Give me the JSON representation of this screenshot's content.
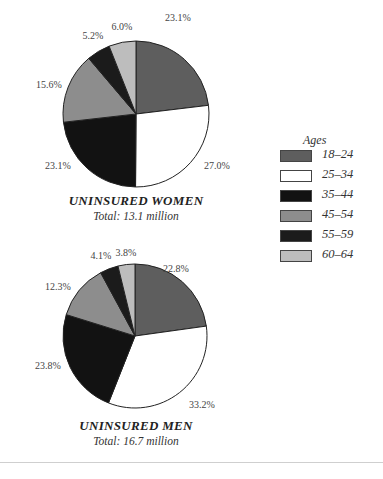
{
  "chart_data": [
    {
      "type": "pie",
      "title": "UNINSURED WOMEN",
      "subtitle": "Total: 13.1 million",
      "categories": [
        "18–24",
        "25–34",
        "35–44",
        "45–54",
        "55–59",
        "60–64"
      ],
      "values": [
        23.1,
        27.0,
        23.1,
        15.6,
        5.2,
        6.0
      ],
      "labels": [
        "23.1%",
        "27.0%",
        "23.1%",
        "15.6%",
        "5.2%",
        "6.0%"
      ],
      "start_angle": "12 o'clock",
      "direction": "clockwise",
      "legend_position": "right"
    },
    {
      "type": "pie",
      "title": "UNINSURED MEN",
      "subtitle": "Total: 16.7 million",
      "categories": [
        "18–24",
        "25–34",
        "35–44",
        "45–54",
        "55–59",
        "60–64"
      ],
      "values": [
        22.8,
        33.2,
        23.8,
        12.3,
        4.1,
        3.8
      ],
      "labels": [
        "22.8%",
        "33.2%",
        "23.8%",
        "12.3%",
        "4.1%",
        "3.8%"
      ],
      "start_angle": "12 o'clock",
      "direction": "clockwise",
      "legend_position": "right"
    }
  ],
  "legend": {
    "title": "Ages",
    "items": [
      {
        "label": "18–24",
        "color": "#5e5e5e"
      },
      {
        "label": "25–34",
        "color": "#ffffff"
      },
      {
        "label": "35–44",
        "color": "#121212"
      },
      {
        "label": "45–54",
        "color": "#8d8d8d"
      },
      {
        "label": "55–59",
        "color": "#1b1b1b"
      },
      {
        "label": "60–64",
        "color": "#bdbdbd"
      }
    ]
  },
  "women": {
    "title": "UNINSURED WOMEN",
    "subtitle": "Total: 13.1 million",
    "labels": [
      "23.1%",
      "27.0%",
      "23.1%",
      "15.6%",
      "5.2%",
      "6.0%"
    ]
  },
  "men": {
    "title": "UNINSURED MEN",
    "subtitle": "Total: 16.7 million",
    "labels": [
      "22.8%",
      "33.2%",
      "23.8%",
      "12.3%",
      "4.1%",
      "3.8%"
    ]
  }
}
